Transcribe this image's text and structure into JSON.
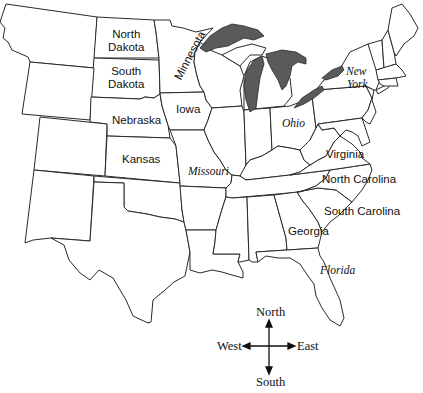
{
  "map": {
    "title": "",
    "states": {
      "north_dakota": "North\nDakota",
      "north_dakota_l1": "North",
      "north_dakota_l2": "Dakota",
      "south_dakota_l1": "South",
      "south_dakota_l2": "Dakota",
      "minnesota": "Minnesota",
      "iowa": "Iowa",
      "nebraska": "Nebraska",
      "kansas": "Kansas",
      "missouri": "Missouri",
      "ohio": "Ohio",
      "new_york_l1": "New",
      "new_york_l2": "York",
      "virginia": "Virginia",
      "north_carolina": "North Carolina",
      "south_carolina": "South Carolina",
      "georgia": "Georgia",
      "florida": "Florida"
    },
    "label_styles": {
      "plain": [
        "North Dakota",
        "South Dakota",
        "Minnesota",
        "Iowa",
        "Nebraska",
        "Kansas",
        "Virginia",
        "North Carolina",
        "South Carolina",
        "Georgia"
      ],
      "italic": [
        "Missouri",
        "Ohio",
        "New York",
        "Florida"
      ]
    },
    "colors": {
      "land": "#ffffff",
      "border": "#2a2a2a",
      "lakes": "#5a5a5a"
    }
  },
  "compass": {
    "north": "North",
    "south": "South",
    "east": "East",
    "west": "West"
  }
}
